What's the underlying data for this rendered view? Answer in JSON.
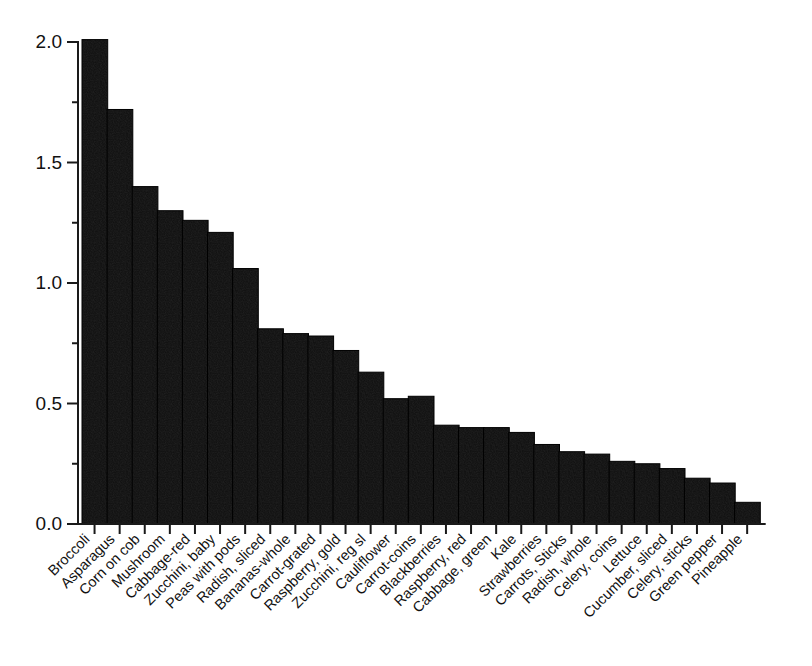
{
  "chart_data": {
    "type": "bar",
    "title": "",
    "subtitle": "",
    "xlabel": "",
    "ylabel": "",
    "ylim": [
      0.0,
      2.0
    ],
    "grid": false,
    "legend": "none",
    "orientation": "vertical",
    "bar_color": "#111111",
    "axis_color": "#1a1a1a",
    "background_color": "#ffffff",
    "xtick_label_rotation": 45,
    "ytick_labels": [
      "0.0",
      "0.5",
      "1.0",
      "1.5",
      "2.0"
    ],
    "ytick_values": [
      0.0,
      0.5,
      1.0,
      1.5,
      2.0
    ],
    "yminor_tick_values": [
      0.25,
      0.75,
      1.25,
      1.75
    ],
    "categories": [
      "Broccoli",
      "Asparagus",
      "Corn on cob",
      "Mushroom",
      "Cabbage-red",
      "Zucchini, baby",
      "Peas with pods",
      "Radish, sliced",
      "Bananas-whole",
      "Carrot-grated",
      "Raspberry, gold",
      "Zucchini, reg sl",
      "Cauliflower",
      "Carrot-coins",
      "Blackberries",
      "Raspberry, red",
      "Cabbage, green",
      "Kale",
      "Strawberries",
      "Carrots, Sticks",
      "Radish, whole",
      "Celery, coins",
      "Lettuce",
      "Cucumber, sliced",
      "Celery, sticks",
      "Green pepper",
      "Pineapple"
    ],
    "values": [
      2.01,
      1.72,
      1.4,
      1.3,
      1.26,
      1.21,
      1.06,
      0.81,
      0.79,
      0.78,
      0.72,
      0.63,
      0.52,
      0.53,
      0.41,
      0.4,
      0.4,
      0.38,
      0.33,
      0.3,
      0.29,
      0.26,
      0.25,
      0.23,
      0.19,
      0.17,
      0.09
    ]
  },
  "axes": {
    "y_axis_name": "value-axis",
    "x_axis_name": "category-axis"
  }
}
